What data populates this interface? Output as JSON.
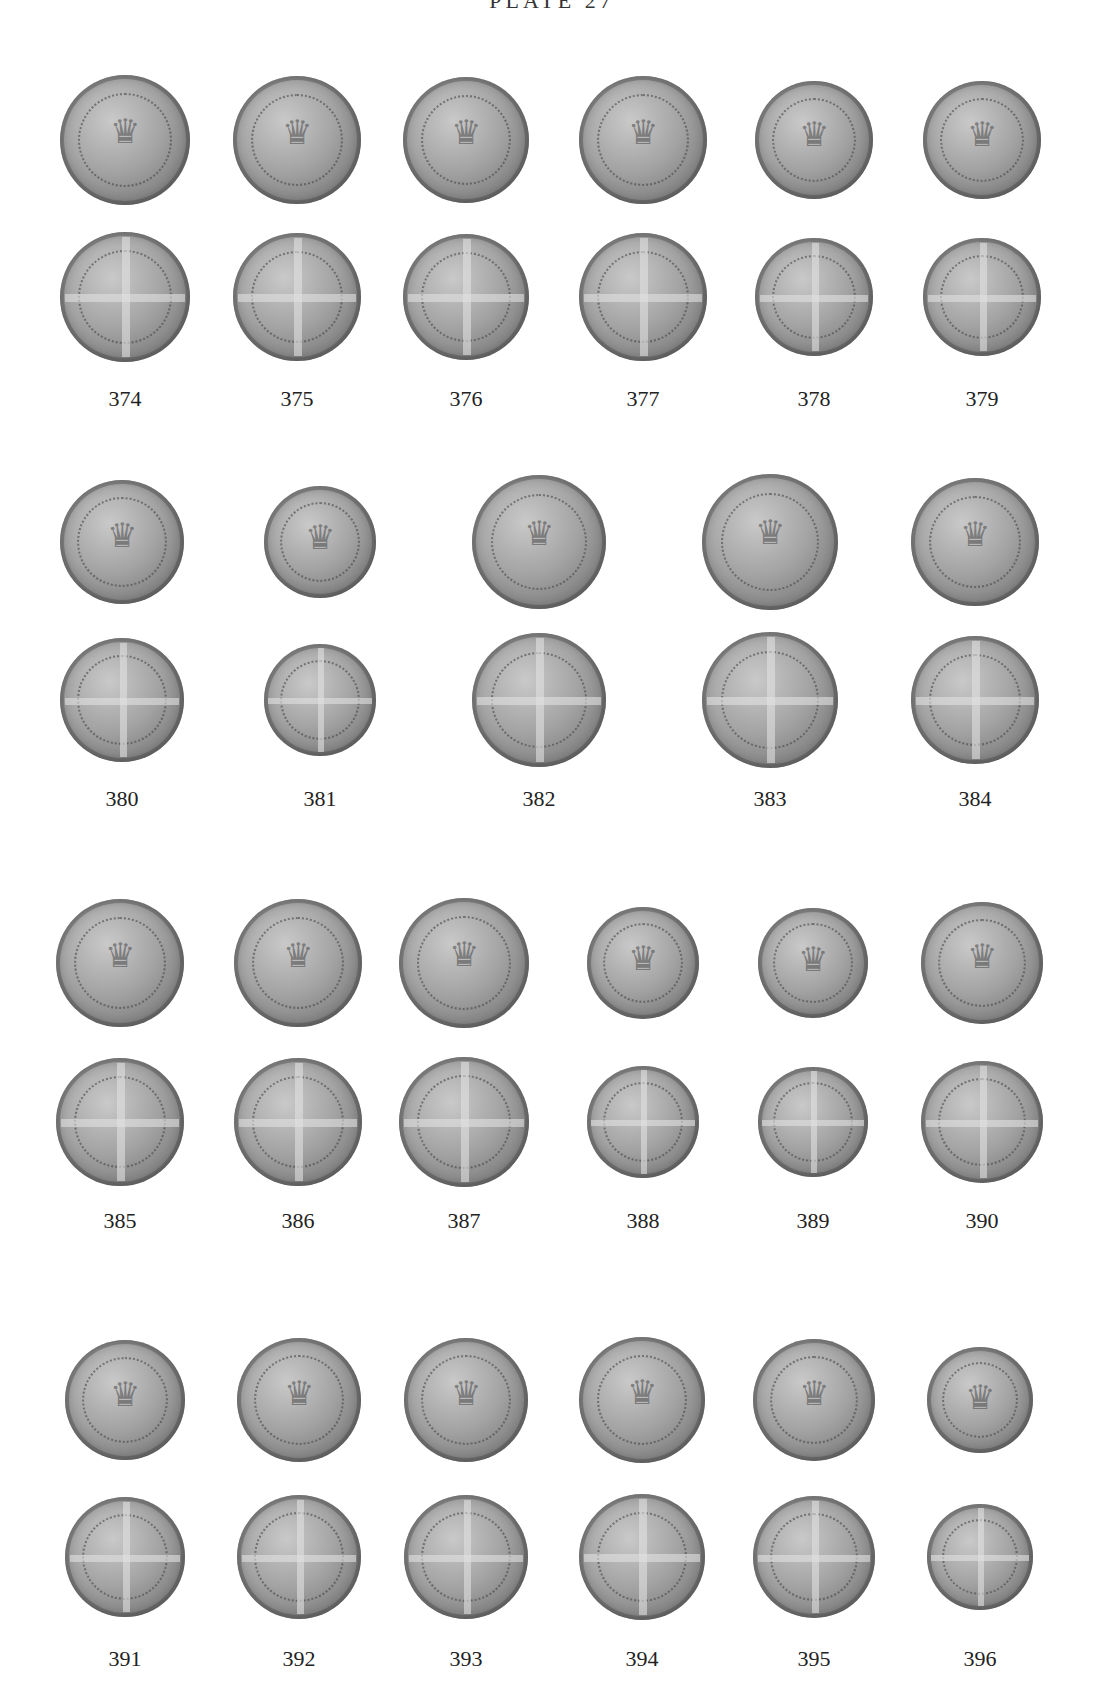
{
  "page": {
    "title": "PLATE 27"
  },
  "rows": [
    {
      "coins": [
        {
          "number": "374",
          "cx": 125,
          "obv_y": 140,
          "rev_y": 297,
          "d": 130
        },
        {
          "number": "375",
          "cx": 297,
          "obv_y": 140,
          "rev_y": 297,
          "d": 128
        },
        {
          "number": "376",
          "cx": 466,
          "obv_y": 140,
          "rev_y": 297,
          "d": 126
        },
        {
          "number": "377",
          "cx": 643,
          "obv_y": 140,
          "rev_y": 297,
          "d": 128
        },
        {
          "number": "378",
          "cx": 814,
          "obv_y": 140,
          "rev_y": 297,
          "d": 118
        },
        {
          "number": "379",
          "cx": 982,
          "obv_y": 140,
          "rev_y": 297,
          "d": 118
        }
      ],
      "label_y": 400
    },
    {
      "coins": [
        {
          "number": "380",
          "cx": 122,
          "obv_y": 542,
          "rev_y": 700,
          "d": 124
        },
        {
          "number": "381",
          "cx": 320,
          "obv_y": 542,
          "rev_y": 700,
          "d": 112
        },
        {
          "number": "382",
          "cx": 539,
          "obv_y": 542,
          "rev_y": 700,
          "d": 134
        },
        {
          "number": "383",
          "cx": 770,
          "obv_y": 542,
          "rev_y": 700,
          "d": 136
        },
        {
          "number": "384",
          "cx": 975,
          "obv_y": 542,
          "rev_y": 700,
          "d": 128
        }
      ],
      "label_y": 800
    },
    {
      "coins": [
        {
          "number": "385",
          "cx": 120,
          "obv_y": 963,
          "rev_y": 1122,
          "d": 128
        },
        {
          "number": "386",
          "cx": 298,
          "obv_y": 963,
          "rev_y": 1122,
          "d": 128
        },
        {
          "number": "387",
          "cx": 464,
          "obv_y": 963,
          "rev_y": 1122,
          "d": 130
        },
        {
          "number": "388",
          "cx": 643,
          "obv_y": 963,
          "rev_y": 1122,
          "d": 112
        },
        {
          "number": "389",
          "cx": 813,
          "obv_y": 963,
          "rev_y": 1122,
          "d": 110
        },
        {
          "number": "390",
          "cx": 982,
          "obv_y": 963,
          "rev_y": 1122,
          "d": 122
        }
      ],
      "label_y": 1222
    },
    {
      "coins": [
        {
          "number": "391",
          "cx": 125,
          "obv_y": 1400,
          "rev_y": 1557,
          "d": 120
        },
        {
          "number": "392",
          "cx": 299,
          "obv_y": 1400,
          "rev_y": 1557,
          "d": 124
        },
        {
          "number": "393",
          "cx": 466,
          "obv_y": 1400,
          "rev_y": 1557,
          "d": 124
        },
        {
          "number": "394",
          "cx": 642,
          "obv_y": 1400,
          "rev_y": 1557,
          "d": 126
        },
        {
          "number": "395",
          "cx": 814,
          "obv_y": 1400,
          "rev_y": 1557,
          "d": 122
        },
        {
          "number": "396",
          "cx": 980,
          "obv_y": 1400,
          "rev_y": 1557,
          "d": 106
        }
      ],
      "label_y": 1660
    }
  ]
}
